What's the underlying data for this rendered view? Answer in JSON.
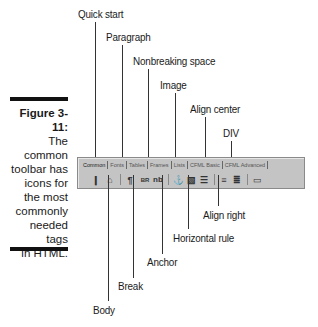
{
  "caption": {
    "figure": "Figure 3-11:",
    "lines": [
      "The",
      "common",
      "toolbar has",
      "icons for",
      "the most",
      "commonly",
      "needed tags",
      "in HTML."
    ]
  },
  "callouts_top": {
    "quick_start": "Quick start",
    "paragraph": "Paragraph",
    "nonbreaking_space": "Nonbreaking space",
    "image": "Image",
    "align_center": "Align center",
    "div": "DIV"
  },
  "callouts_bottom": {
    "align_right": "Align right",
    "horizontal_rule": "Horizontal rule",
    "anchor": "Anchor",
    "break": "Break",
    "body": "Body"
  },
  "toolbar": {
    "tabs": [
      "Common",
      "Fonts",
      "Tables",
      "Frames",
      "Lists",
      "CFML Basic",
      "CFML Advanced"
    ],
    "active_tab": "Common",
    "icons": {
      "quick_start": "❙",
      "body": "⌂",
      "paragraph": "¶",
      "break": "BR",
      "nbsp": "nb",
      "anchor": "⚓",
      "image": "▧",
      "hr": "☰",
      "align_center": "≡",
      "align_right": "≣",
      "div": "▭"
    }
  }
}
